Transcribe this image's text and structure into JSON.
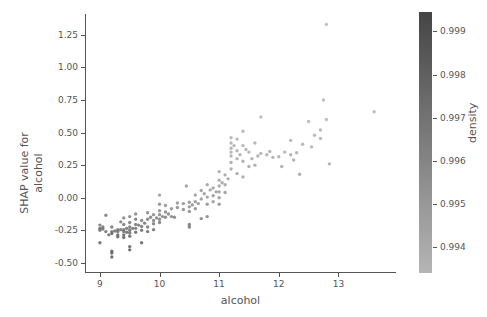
{
  "figure": {
    "background": "#ffffff",
    "foreground": "#555555",
    "width": 487,
    "height": 317
  },
  "chart_data": {
    "type": "scatter",
    "title": "",
    "xlabel": "alcohol",
    "ylabel": "SHAP value for\nalcohol",
    "ylabel_line1": "SHAP value for",
    "ylabel_line2": "alcohol",
    "xlim": [
      8.75,
      13.95
    ],
    "ylim": [
      -0.57,
      1.41
    ],
    "xticks": [
      9,
      10,
      11,
      12,
      13
    ],
    "xticklabels": [
      "9",
      "10",
      "11",
      "12",
      "13"
    ],
    "yticks": [
      1.25,
      1.0,
      0.75,
      0.5,
      0.25,
      0.0,
      -0.25,
      -0.5
    ],
    "yticklabels": [
      "1.25",
      "1.00",
      "0.75",
      "0.50",
      "0.25",
      "0.00",
      "-0.25",
      "-0.50"
    ],
    "grid": false,
    "legend": null,
    "marker": {
      "shape": "circle",
      "size_px": 3.4,
      "opacity": 0.85,
      "edge": "none"
    },
    "colorbar": {
      "label": "density",
      "position": "right",
      "orientation": "vertical",
      "cmap": "gray-reversed",
      "color_dark": "#454545",
      "color_light": "#b5b5b5",
      "vmin": 0.9934,
      "vmax": 0.99945,
      "ticks": [
        0.999,
        0.998,
        0.997,
        0.996,
        0.995,
        0.994
      ],
      "ticklabels": [
        "0.999",
        "0.998",
        "0.997",
        "0.996",
        "0.995",
        "0.994"
      ]
    },
    "color_field": "density",
    "points": [
      [
        9.0,
        -0.21,
        0.9968
      ],
      [
        9.0,
        -0.235,
        0.9975
      ],
      [
        9.0,
        -0.25,
        0.9971
      ],
      [
        9.0,
        -0.345,
        0.9978
      ],
      [
        9.05,
        -0.225,
        0.9969
      ],
      [
        9.05,
        -0.24,
        0.9973
      ],
      [
        9.1,
        -0.135,
        0.9966
      ],
      [
        9.1,
        -0.26,
        0.9972
      ],
      [
        9.15,
        -0.285,
        0.9974
      ],
      [
        9.2,
        -0.225,
        0.997
      ],
      [
        9.2,
        -0.26,
        0.9976
      ],
      [
        9.2,
        -0.275,
        0.9977
      ],
      [
        9.2,
        -0.41,
        0.9981
      ],
      [
        9.2,
        -0.425,
        0.9982
      ],
      [
        9.2,
        -0.455,
        0.9983
      ],
      [
        9.25,
        -0.255,
        0.9973
      ],
      [
        9.3,
        -0.245,
        0.9971
      ],
      [
        9.3,
        -0.26,
        0.9975
      ],
      [
        9.3,
        -0.285,
        0.9978
      ],
      [
        9.3,
        -0.3,
        0.9979
      ],
      [
        9.35,
        -0.185,
        0.9967
      ],
      [
        9.35,
        -0.245,
        0.9972
      ],
      [
        9.4,
        -0.155,
        0.9965
      ],
      [
        9.4,
        -0.205,
        0.9969
      ],
      [
        9.4,
        -0.245,
        0.9974
      ],
      [
        9.4,
        -0.26,
        0.9976
      ],
      [
        9.4,
        -0.285,
        0.9977
      ],
      [
        9.4,
        -0.305,
        0.998
      ],
      [
        9.45,
        -0.235,
        0.9972
      ],
      [
        9.45,
        -0.265,
        0.9975
      ],
      [
        9.5,
        -0.145,
        0.9963
      ],
      [
        9.5,
        -0.19,
        0.9968
      ],
      [
        9.5,
        -0.225,
        0.997
      ],
      [
        9.5,
        -0.25,
        0.9973
      ],
      [
        9.5,
        -0.27,
        0.9976
      ],
      [
        9.5,
        -0.295,
        0.9978
      ],
      [
        9.5,
        -0.375,
        0.9981
      ],
      [
        9.5,
        -0.4,
        0.9982
      ],
      [
        9.55,
        -0.235,
        0.9971
      ],
      [
        9.6,
        -0.125,
        0.9962
      ],
      [
        9.6,
        -0.165,
        0.9966
      ],
      [
        9.6,
        -0.205,
        0.9969
      ],
      [
        9.6,
        -0.235,
        0.9972
      ],
      [
        9.6,
        -0.265,
        0.9975
      ],
      [
        9.65,
        -0.21,
        0.997
      ],
      [
        9.7,
        -0.175,
        0.9965
      ],
      [
        9.7,
        -0.22,
        0.9971
      ],
      [
        9.7,
        -0.25,
        0.9974
      ],
      [
        9.7,
        -0.345,
        0.998
      ],
      [
        9.75,
        -0.195,
        0.9968
      ],
      [
        9.8,
        -0.115,
        0.996
      ],
      [
        9.8,
        -0.165,
        0.9964
      ],
      [
        9.8,
        -0.225,
        0.9971
      ],
      [
        9.8,
        -0.26,
        0.9975
      ],
      [
        9.85,
        -0.15,
        0.9963
      ],
      [
        9.9,
        -0.13,
        0.9961
      ],
      [
        9.9,
        -0.175,
        0.9966
      ],
      [
        9.9,
        -0.2,
        0.9969
      ],
      [
        9.9,
        -0.245,
        0.9973
      ],
      [
        9.95,
        -0.155,
        0.9964
      ],
      [
        10.0,
        0.02,
        0.9952
      ],
      [
        10.0,
        -0.05,
        0.9957
      ],
      [
        10.0,
        -0.1,
        0.9959
      ],
      [
        10.0,
        -0.13,
        0.9961
      ],
      [
        10.0,
        -0.165,
        0.9965
      ],
      [
        10.0,
        -0.19,
        0.9967
      ],
      [
        10.05,
        -0.145,
        0.9962
      ],
      [
        10.1,
        -0.06,
        0.9956
      ],
      [
        10.1,
        -0.11,
        0.996
      ],
      [
        10.1,
        -0.15,
        0.9963
      ],
      [
        10.15,
        -0.125,
        0.9961
      ],
      [
        10.2,
        -0.085,
        0.9957
      ],
      [
        10.2,
        -0.145,
        0.9962
      ],
      [
        10.25,
        -0.15,
        0.9963
      ],
      [
        10.3,
        -0.04,
        0.9954
      ],
      [
        10.3,
        -0.075,
        0.9956
      ],
      [
        10.4,
        -0.045,
        0.9955
      ],
      [
        10.4,
        -0.09,
        0.9958
      ],
      [
        10.45,
        0.09,
        0.9949
      ],
      [
        10.5,
        -0.035,
        0.9954
      ],
      [
        10.5,
        -0.07,
        0.9956
      ],
      [
        10.5,
        -0.105,
        0.9959
      ],
      [
        10.5,
        -0.205,
        0.9968
      ],
      [
        10.5,
        -0.225,
        0.997
      ],
      [
        10.55,
        -0.055,
        0.9955
      ],
      [
        10.6,
        0.02,
        0.9951
      ],
      [
        10.6,
        -0.03,
        0.9953
      ],
      [
        10.6,
        -0.085,
        0.9957
      ],
      [
        10.65,
        -0.045,
        0.9954
      ],
      [
        10.7,
        0.055,
        0.9949
      ],
      [
        10.7,
        -0.01,
        0.9952
      ],
      [
        10.7,
        -0.16,
        0.9964
      ],
      [
        10.75,
        0.03,
        0.995
      ],
      [
        10.8,
        0.1,
        0.9947
      ],
      [
        10.8,
        0.005,
        0.9951
      ],
      [
        10.8,
        -0.05,
        0.9955
      ],
      [
        10.8,
        -0.145,
        0.9962
      ],
      [
        10.85,
        0.06,
        0.9948
      ],
      [
        10.9,
        0.075,
        0.9947
      ],
      [
        10.9,
        0.015,
        0.995
      ],
      [
        10.9,
        -0.03,
        0.9953
      ],
      [
        10.95,
        0.045,
        0.9949
      ],
      [
        11.0,
        0.2,
        0.9943
      ],
      [
        11.0,
        0.135,
        0.9945
      ],
      [
        11.0,
        0.09,
        0.9947
      ],
      [
        11.0,
        0.045,
        0.9949
      ],
      [
        11.0,
        0.0,
        0.9952
      ],
      [
        11.0,
        -0.05,
        0.9955
      ],
      [
        11.05,
        0.115,
        0.9946
      ],
      [
        11.1,
        0.175,
        0.9944
      ],
      [
        11.1,
        0.1,
        0.9947
      ],
      [
        11.1,
        0.04,
        0.995
      ],
      [
        11.15,
        0.145,
        0.9945
      ],
      [
        11.2,
        0.46,
        0.9938
      ],
      [
        11.2,
        0.42,
        0.9939
      ],
      [
        11.2,
        0.38,
        0.994
      ],
      [
        11.2,
        0.35,
        0.994
      ],
      [
        11.2,
        0.32,
        0.9941
      ],
      [
        11.2,
        0.27,
        0.9942
      ],
      [
        11.2,
        0.22,
        0.9943
      ],
      [
        11.25,
        0.4,
        0.9939
      ],
      [
        11.3,
        0.45,
        0.9938
      ],
      [
        11.3,
        0.36,
        0.994
      ],
      [
        11.3,
        0.3,
        0.9941
      ],
      [
        11.3,
        0.185,
        0.9944
      ],
      [
        11.35,
        0.33,
        0.9941
      ],
      [
        11.4,
        0.51,
        0.9937
      ],
      [
        11.4,
        0.4,
        0.9939
      ],
      [
        11.4,
        0.28,
        0.9942
      ],
      [
        11.4,
        0.16,
        0.9945
      ],
      [
        11.45,
        0.37,
        0.994
      ],
      [
        11.5,
        0.35,
        0.994
      ],
      [
        11.5,
        0.24,
        0.9943
      ],
      [
        11.55,
        0.3,
        0.9941
      ],
      [
        11.6,
        0.42,
        0.9939
      ],
      [
        11.6,
        0.25,
        0.9942
      ],
      [
        11.65,
        0.32,
        0.9941
      ],
      [
        11.7,
        0.62,
        0.9935
      ],
      [
        11.7,
        0.34,
        0.994
      ],
      [
        11.8,
        0.33,
        0.9941
      ],
      [
        11.85,
        0.355,
        0.994
      ],
      [
        11.9,
        0.31,
        0.9941
      ],
      [
        12.0,
        0.315,
        0.9941
      ],
      [
        12.05,
        0.24,
        0.9943
      ],
      [
        12.1,
        0.35,
        0.994
      ],
      [
        12.2,
        0.44,
        0.9938
      ],
      [
        12.2,
        0.33,
        0.9941
      ],
      [
        12.25,
        0.29,
        0.9942
      ],
      [
        12.3,
        0.345,
        0.994
      ],
      [
        12.35,
        0.18,
        0.9944
      ],
      [
        12.4,
        0.41,
        0.9939
      ],
      [
        12.5,
        0.585,
        0.9936
      ],
      [
        12.55,
        0.39,
        0.9939
      ],
      [
        12.6,
        0.48,
        0.9937
      ],
      [
        12.7,
        0.52,
        0.9937
      ],
      [
        12.7,
        0.455,
        0.9938
      ],
      [
        12.75,
        0.75,
        0.9934
      ],
      [
        12.8,
        1.33,
        0.9934
      ],
      [
        12.8,
        0.6,
        0.9935
      ],
      [
        12.85,
        0.26,
        0.9942
      ],
      [
        13.6,
        0.66,
        0.9935
      ]
    ]
  }
}
